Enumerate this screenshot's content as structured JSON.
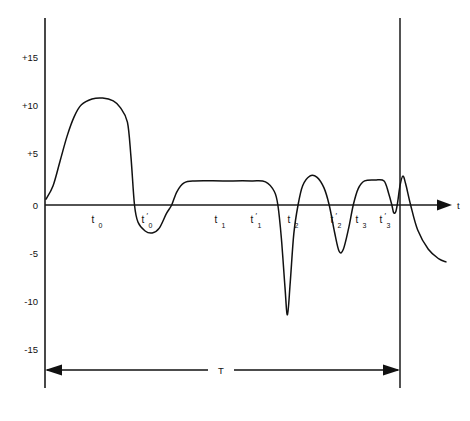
{
  "figure": {
    "title": "",
    "axis_t_label": "t",
    "period_label": "T",
    "background_color": "#ffffff",
    "ink_color": "#111111"
  },
  "chart_data": {
    "type": "line",
    "title": "",
    "subtitle": "",
    "xlabel": "t",
    "ylabel": "",
    "grid": false,
    "legend_position": "none",
    "ylim": [
      -17,
      17
    ],
    "xlim": [
      0,
      1
    ],
    "y_ticks": [
      "+15",
      "+10",
      "+5",
      "0",
      "-5",
      "-10",
      "-15"
    ],
    "y_tick_values": [
      15,
      10,
      5,
      0,
      -5,
      -10,
      -15
    ],
    "x_ticks": [
      {
        "base": "t",
        "sub": "0",
        "prime": false,
        "label": "t0"
      },
      {
        "base": "t",
        "sub": "0",
        "prime": true,
        "label": "t'0"
      },
      {
        "base": "t",
        "sub": "1",
        "prime": false,
        "label": "t1"
      },
      {
        "base": "t",
        "sub": "1",
        "prime": true,
        "label": "t'1"
      },
      {
        "base": "t",
        "sub": "2",
        "prime": false,
        "label": "t2"
      },
      {
        "base": "t",
        "sub": "2",
        "prime": true,
        "label": "t'2"
      },
      {
        "base": "t",
        "sub": "3",
        "prime": false,
        "label": "t3"
      },
      {
        "base": "t",
        "sub": "3",
        "prime": true,
        "label": "t'3"
      }
    ],
    "annotations": [
      {
        "name": "period-span",
        "text": "T",
        "type": "double-arrow-dimension"
      },
      {
        "name": "t-axis-arrow",
        "text": "t",
        "type": "axis-arrow"
      }
    ],
    "series": [
      {
        "name": "waveform",
        "description": "Periodic waveform with a large positive lobe followed by oscillating lobes and a deep negative spike",
        "points": [
          [
            0.0,
            0.6
          ],
          [
            0.02,
            2.0
          ],
          [
            0.04,
            4.6
          ],
          [
            0.06,
            7.2
          ],
          [
            0.08,
            9.2
          ],
          [
            0.1,
            10.4
          ],
          [
            0.13,
            11.0
          ],
          [
            0.16,
            11.1
          ],
          [
            0.19,
            10.8
          ],
          [
            0.21,
            10.1
          ],
          [
            0.23,
            8.6
          ],
          [
            0.24,
            5.0
          ],
          [
            0.25,
            0.0
          ],
          [
            0.26,
            -1.8
          ],
          [
            0.28,
            -2.7
          ],
          [
            0.3,
            -2.9
          ],
          [
            0.32,
            -2.4
          ],
          [
            0.34,
            -0.9
          ],
          [
            0.355,
            0.0
          ],
          [
            0.37,
            1.4
          ],
          [
            0.39,
            2.3
          ],
          [
            0.42,
            2.5
          ],
          [
            0.5,
            2.5
          ],
          [
            0.58,
            2.5
          ],
          [
            0.62,
            2.4
          ],
          [
            0.645,
            1.4
          ],
          [
            0.655,
            0.0
          ],
          [
            0.665,
            -3.5
          ],
          [
            0.675,
            -8.5
          ],
          [
            0.682,
            -11.4
          ],
          [
            0.69,
            -8.0
          ],
          [
            0.7,
            -3.0
          ],
          [
            0.712,
            0.0
          ],
          [
            0.725,
            2.0
          ],
          [
            0.745,
            3.0
          ],
          [
            0.765,
            2.9
          ],
          [
            0.785,
            1.8
          ],
          [
            0.8,
            0.0
          ],
          [
            0.815,
            -2.8
          ],
          [
            0.828,
            -4.8
          ],
          [
            0.84,
            -4.6
          ],
          [
            0.855,
            -2.4
          ],
          [
            0.868,
            0.0
          ],
          [
            0.882,
            1.7
          ],
          [
            0.9,
            2.5
          ],
          [
            0.93,
            2.6
          ],
          [
            0.955,
            2.5
          ],
          [
            0.968,
            1.2
          ],
          [
            0.977,
            0.0
          ],
          [
            0.982,
            -0.8
          ],
          [
            0.988,
            -0.7
          ],
          [
            0.993,
            0.2
          ],
          [
            1.0,
            2.0
          ],
          [
            1.008,
            3.0
          ],
          [
            1.016,
            2.2
          ],
          [
            1.03,
            0.0
          ],
          [
            1.05,
            -2.6
          ],
          [
            1.08,
            -4.6
          ],
          [
            1.11,
            -5.6
          ],
          [
            1.13,
            -5.9
          ]
        ]
      }
    ]
  }
}
